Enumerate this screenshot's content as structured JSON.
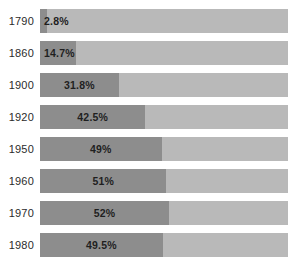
{
  "chart_data": {
    "type": "bar",
    "subtype": "stacked-percentage-horizontal",
    "title": "",
    "subtitle": "",
    "xlabel": "",
    "ylabel": "",
    "xlim": [
      0,
      100
    ],
    "grid": false,
    "legend": "none",
    "orientation": "horizontal",
    "categories": [
      "1790",
      "1860",
      "1900",
      "1920",
      "1950",
      "1960",
      "1970",
      "1980"
    ],
    "values": [
      2.8,
      14.7,
      31.8,
      42.5,
      49,
      51,
      52,
      49.5
    ],
    "value_labels": [
      "2.8%",
      "14.7%",
      "31.8%",
      "42.5%",
      "49%",
      "51%",
      "52%",
      "49.5%"
    ],
    "remainder_values": [
      97.2,
      85.3,
      68.2,
      57.5,
      51,
      49,
      48,
      50.5
    ],
    "series": [
      {
        "name": "filled",
        "color": "#8d8d8d",
        "values": [
          2.8,
          14.7,
          31.8,
          42.5,
          49,
          51,
          52,
          49.5
        ]
      },
      {
        "name": "remainder",
        "color": "#b9b9b9",
        "values": [
          97.2,
          85.3,
          68.2,
          57.5,
          51,
          49,
          48,
          50.5
        ]
      }
    ]
  },
  "rows": [
    {
      "year": "1790",
      "value": 2.8,
      "label": "2.8%",
      "label_position": "outside"
    },
    {
      "year": "1860",
      "value": 14.7,
      "label": "14.7%",
      "label_position": "outside"
    },
    {
      "year": "1900",
      "value": 31.8,
      "label": "31.8%",
      "label_position": "inside"
    },
    {
      "year": "1920",
      "value": 42.5,
      "label": "42.5%",
      "label_position": "inside"
    },
    {
      "year": "1950",
      "value": 49,
      "label": "49%",
      "label_position": "inside"
    },
    {
      "year": "1960",
      "value": 51,
      "label": "51%",
      "label_position": "inside"
    },
    {
      "year": "1970",
      "value": 52,
      "label": "52%",
      "label_position": "inside"
    },
    {
      "year": "1980",
      "value": 49.5,
      "label": "49.5%",
      "label_position": "inside"
    }
  ],
  "colors": {
    "fill": "#8d8d8d",
    "track": "#b9b9b9",
    "background": "#ffffff",
    "label_text": "#2b2b2b",
    "value_text": "#1f1f1f"
  }
}
